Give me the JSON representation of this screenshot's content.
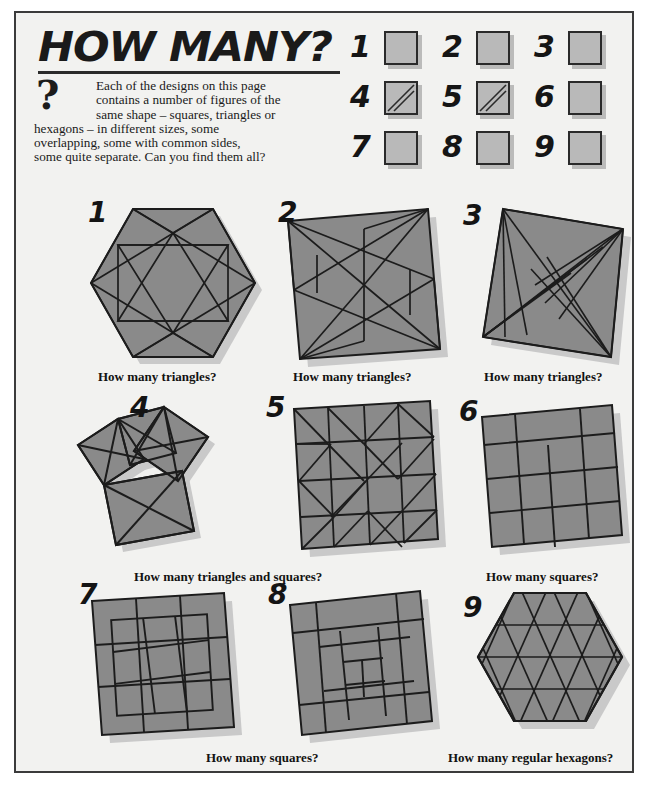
{
  "header": {
    "title": "HOW MANY?",
    "qmark_icon": "question-mark-icon",
    "intro_line1": "Each of the designs on this page",
    "intro_line2": "contains a number of figures of the",
    "intro_line3": "same shape – squares, triangles or",
    "intro_line4": "hexagons – in different sizes, some",
    "intro_line5": "overlapping, some with common sides,",
    "intro_line6": "some quite separate. Can you find them all?"
  },
  "answer_boxes": [
    {
      "number": "1",
      "value": "",
      "diagonal": false
    },
    {
      "number": "2",
      "value": "",
      "diagonal": false
    },
    {
      "number": "3",
      "value": "",
      "diagonal": false
    },
    {
      "number": "4",
      "value": "",
      "diagonal": true
    },
    {
      "number": "5",
      "value": "",
      "diagonal": true
    },
    {
      "number": "6",
      "value": "",
      "diagonal": false
    },
    {
      "number": "7",
      "value": "",
      "diagonal": false
    },
    {
      "number": "8",
      "value": "",
      "diagonal": false
    },
    {
      "number": "9",
      "value": "",
      "diagonal": false
    }
  ],
  "puzzles": [
    {
      "number": "1",
      "shape": "hexagon-with-inscribed-star"
    },
    {
      "number": "2",
      "shape": "tilted-square-pinwheel"
    },
    {
      "number": "3",
      "shape": "square-corner-fan-triangles"
    },
    {
      "number": "4",
      "shape": "overlapping-rotated-squares"
    },
    {
      "number": "5",
      "shape": "square-grid-with-diagonals"
    },
    {
      "number": "6",
      "shape": "offset-square-grid"
    },
    {
      "number": "7",
      "shape": "nested-offset-square-grid"
    },
    {
      "number": "8",
      "shape": "spiral-square-subdivision"
    },
    {
      "number": "9",
      "shape": "hexagon-triangular-lattice"
    }
  ],
  "captions": {
    "row1_c1": "How many triangles?",
    "row1_c2": "How many triangles?",
    "row1_c3": "How many triangles?",
    "row2_c1": "How many triangles and squares?",
    "row2_c2": "How many squares?",
    "row3_c1": "How many  squares?",
    "row3_c2": "How many regular hexagons?"
  },
  "colors": {
    "page_background": "#f2f2f0",
    "frame": "#3b3b3b",
    "figure_fill": "#8a8a8a",
    "figure_stroke": "#1c1c1c",
    "shadow": "#c9c9c9",
    "ink": "#141414",
    "box_fill": "#b9b9b9"
  }
}
